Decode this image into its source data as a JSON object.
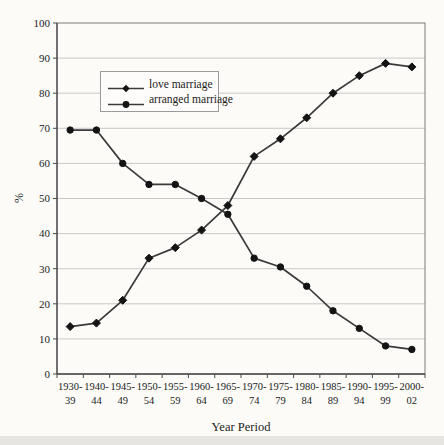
{
  "chart_data": {
    "type": "line",
    "title": "",
    "xlabel": "Year Period",
    "ylabel": "%",
    "ylim": [
      0,
      100
    ],
    "ytick_step": 10,
    "grid": true,
    "legend_position": "upper-left-inside",
    "categories": [
      [
        "1930-",
        "39"
      ],
      [
        "1940-",
        "44"
      ],
      [
        "1945-",
        "49"
      ],
      [
        "1950-",
        "54"
      ],
      [
        "1955-",
        "59"
      ],
      [
        "1960-",
        "64"
      ],
      [
        "1965-",
        "69"
      ],
      [
        "1970-",
        "74"
      ],
      [
        "1975-",
        "79"
      ],
      [
        "1980-",
        "84"
      ],
      [
        "1985-",
        "89"
      ],
      [
        "1990-",
        "94"
      ],
      [
        "1995-",
        "99"
      ],
      [
        "2000-",
        "02"
      ]
    ],
    "series": [
      {
        "name": "love marriage",
        "marker": "diamond",
        "values": [
          13.5,
          14.5,
          21,
          33,
          36,
          41,
          48,
          62,
          67,
          73,
          80,
          85,
          88.5,
          87.5
        ]
      },
      {
        "name": "arranged marriage",
        "marker": "circle",
        "values": [
          69.5,
          69.5,
          60,
          54,
          54,
          50,
          45.5,
          33,
          30.5,
          25,
          18,
          13,
          8,
          7
        ]
      }
    ]
  },
  "colors": {
    "line": "#3a3a3a",
    "marker_fill": "#141414",
    "gridline": "#c9c9c9",
    "plot_border": "#7d7d7d",
    "axis": "#4a4a4a",
    "text": "#1b1b1b",
    "background": "#fcfbf8",
    "legend_border": "#9a9a9a"
  },
  "layout_px": {
    "plot_left": 57,
    "plot_top": 23,
    "plot_right": 425,
    "plot_bottom": 374
  }
}
